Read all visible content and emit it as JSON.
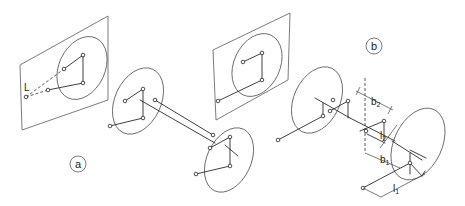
{
  "figure": {
    "panels": [
      {
        "id": "a",
        "label": "a"
      },
      {
        "id": "b",
        "label": "b"
      }
    ],
    "annotations": {
      "light_point": "L",
      "b2": "b",
      "b2_sub": "2",
      "l2": "l",
      "l2_sub": "2",
      "b1": "b",
      "b1_sub": "1",
      "l1": "l",
      "l1_sub": "1"
    },
    "colors": {
      "line": "#2a2a2a",
      "background": "#ffffff"
    }
  }
}
